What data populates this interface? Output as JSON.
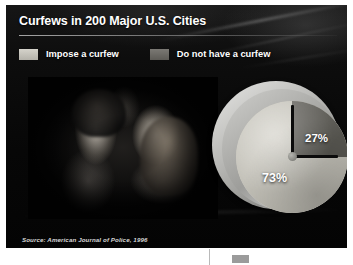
{
  "slide": {
    "title": "Curfews in 200 Major U.S. Cities",
    "source": "Source: American Journal of Police, 1996"
  },
  "legend": {
    "items": [
      {
        "label": "Impose a curfew",
        "color": "#bdbbb2",
        "swatch_name": "legend-swatch-impose"
      },
      {
        "label": "Do not have a curfew",
        "color": "#6f6d68",
        "swatch_name": "legend-swatch-no-curfew"
      }
    ]
  },
  "photo": {
    "alt": "Two teenagers seated inside a car at night, black and white photograph"
  },
  "chart_data": {
    "type": "pie",
    "title": "Curfews in 200 Major U.S. Cities",
    "categories": [
      "Impose a curfew",
      "Do not have a curfew"
    ],
    "values": [
      73,
      27
    ],
    "value_labels": [
      "73%",
      "27%"
    ],
    "colors": [
      "#bdbbb2",
      "#6f6d68"
    ],
    "units": "percent",
    "total_cities": 200,
    "legend_position": "top",
    "grid": false,
    "source": "American Journal of Police, 1996",
    "style_note": "Pie rendered as an analog watch face; minority wedge spans 12 to 3 o'clock with clock hands on the wedge boundaries"
  }
}
